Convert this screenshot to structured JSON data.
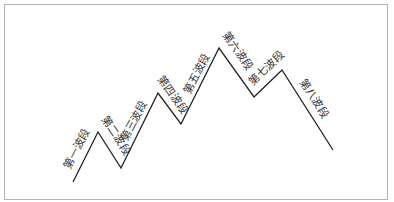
{
  "diagram": {
    "type": "wave-zigzag",
    "line_color": "#222222",
    "frame_color": "#b4b4b4",
    "points": [
      [
        73,
        182
      ],
      [
        98,
        132
      ],
      [
        121,
        168
      ],
      [
        158,
        93
      ],
      [
        181,
        124
      ],
      [
        219,
        48
      ],
      [
        254,
        97
      ],
      [
        282,
        70
      ],
      [
        333,
        150
      ]
    ],
    "segments": [
      {
        "label": "第一波段"
      },
      {
        "label": "第二波段"
      },
      {
        "label": "第三波段"
      },
      {
        "label": "第四波段"
      },
      {
        "label": "第五波段"
      },
      {
        "label": "第六波段"
      },
      {
        "label": "第七波段"
      },
      {
        "label": "第八波段"
      }
    ]
  }
}
